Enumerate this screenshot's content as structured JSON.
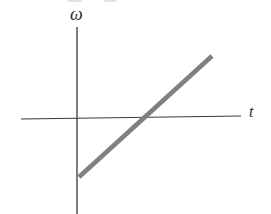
{
  "figure": {
    "background_color": "#ffffff",
    "width": 271,
    "height": 214
  },
  "labels": {
    "y_axis": "ω",
    "x_axis": "t"
  },
  "colors": {
    "axis": "#3a3a3a",
    "data_line": "#808080",
    "label_text": "#2b2b2b"
  },
  "chart_data": {
    "type": "line",
    "title": "",
    "xlabel": "t",
    "ylabel": "ω",
    "grid": false,
    "legend": null,
    "axes": {
      "origin_px": [
        77,
        118
      ],
      "x_axis_px": [
        [
          21,
          119
        ],
        [
          241,
          116
        ]
      ],
      "y_axis_px": [
        [
          77,
          27
        ],
        [
          77,
          214
        ]
      ],
      "x_arrow": false,
      "y_arrow": false,
      "tick_labels_x": [],
      "tick_labels_y": []
    },
    "series": [
      {
        "name": "ω(t)",
        "style": "thick-straight-line",
        "color": "#808080",
        "width_px": 4.6,
        "points_px": [
          [
            79,
            177
          ],
          [
            212,
            56
          ]
        ],
        "points_data": [
          {
            "t": 0.0,
            "omega": -0.65
          },
          {
            "t": 1.78,
            "omega": 0.68
          }
        ],
        "x_intercept_px": [
          140,
          118
        ],
        "x_intercept_data": {
          "t": 0.84,
          "omega": 0.0
        },
        "y_intercept_data": {
          "t": 0.0,
          "omega": -0.65
        },
        "slope_sign": "positive",
        "description": "Straight line of constant positive slope starting below the t-axis at negative omega, crossing the t-axis at a positive time and continuing upward."
      }
    ],
    "xlim": [
      -0.75,
      2.2
    ],
    "ylim": [
      -1.0,
      1.0
    ],
    "annotations": []
  },
  "artifacts": {
    "top_edge_fragments": [
      {
        "left_px": 68,
        "width_px": 14
      },
      {
        "left_px": 104,
        "width_px": 12
      }
    ]
  }
}
